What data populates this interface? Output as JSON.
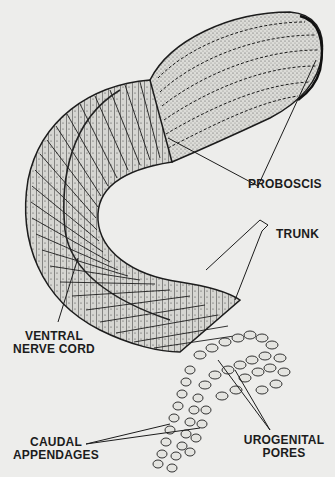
{
  "figure": {
    "colors": {
      "background": "#ededeb",
      "ink": "#1c1c1c",
      "body_fill": "#d8d8d4",
      "shade": "#8a8a86"
    }
  },
  "labels": {
    "proboscis": "PROBOSCIS",
    "trunk": "TRUNK",
    "ventral_nerve_cord": [
      "VENTRAL",
      "NERVE CORD"
    ],
    "caudal_appendages": [
      "CAUDAL",
      "APPENDAGES"
    ],
    "urogenital_pores": [
      "UROGENITAL",
      "PORES"
    ]
  }
}
